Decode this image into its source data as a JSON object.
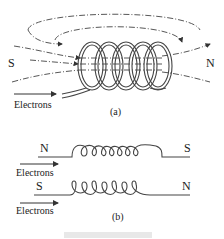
{
  "figure": {
    "part_a": {
      "label": "(a)",
      "pole_left": "S",
      "pole_right": "N",
      "current_label": "Electrons",
      "turns": 5
    },
    "part_b": {
      "label": "(b)",
      "top_coil": {
        "pole_left": "N",
        "pole_right": "S",
        "current_label": "Electrons",
        "turns": 7
      },
      "bottom_coil": {
        "pole_left": "S",
        "pole_right": "N",
        "current_label": "Electrons",
        "turns": 7
      }
    }
  }
}
